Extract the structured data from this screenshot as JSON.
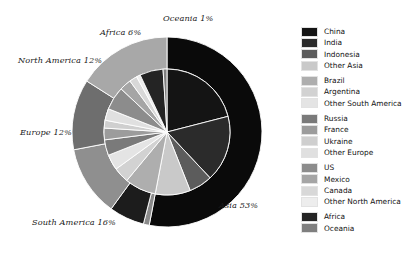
{
  "chart_data": {
    "type": "pie",
    "title": "",
    "subtitle": "",
    "xlabel": "",
    "ylabel": "",
    "legend_position": "right",
    "grid": false,
    "nested": true,
    "outer_ring": {
      "name": "Continent",
      "categories": [
        "Asia",
        "Oceania",
        "Africa",
        "North America",
        "Europe",
        "South America"
      ],
      "values": [
        53,
        1,
        6,
        12,
        12,
        16
      ],
      "labels": [
        "Asia 53%",
        "Oceania 1%",
        "Africa 6%",
        "North America 12%",
        "Europe 12%",
        "South America 16%"
      ],
      "colors": [
        "#0a0a0a",
        "#8a8a8a",
        "#1c1c1c",
        "#8f8f8f",
        "#6e6e6e",
        "#a8a8a8"
      ]
    },
    "inner_pie": {
      "name": "Country",
      "categories": [
        "China",
        "India",
        "Indonesia",
        "Other Asia",
        "Brazil",
        "Argentina",
        "Other South America",
        "Russia",
        "France",
        "Ukraine",
        "Other Europe",
        "US",
        "Mexico",
        "Canada",
        "Other North America",
        "Africa",
        "Oceania"
      ],
      "values": [
        21,
        17,
        6,
        9,
        8,
        4,
        4,
        4,
        3,
        2,
        3,
        6,
        3,
        2,
        1,
        6,
        1
      ],
      "colors": [
        "#141414",
        "#2b2b2b",
        "#5c5c5c",
        "#c9c9c9",
        "#aeaeae",
        "#d2d2d2",
        "#e4e4e4",
        "#7a7a7a",
        "#9c9c9c",
        "#cfcfcf",
        "#e0e0e0",
        "#8c8c8c",
        "#a5a5a5",
        "#d8d8d8",
        "#ededed",
        "#242424",
        "#7f7f7f"
      ]
    }
  },
  "legend": {
    "groups": [
      {
        "name": "asia",
        "items": [
          {
            "label": "China",
            "color": "#141414"
          },
          {
            "label": "India",
            "color": "#2b2b2b"
          },
          {
            "label": "Indonesia",
            "color": "#5c5c5c"
          },
          {
            "label": "Other Asia",
            "color": "#c9c9c9"
          }
        ]
      },
      {
        "name": "south-america",
        "items": [
          {
            "label": "Brazil",
            "color": "#aeaeae"
          },
          {
            "label": "Argentina",
            "color": "#d2d2d2"
          },
          {
            "label": "Other South America",
            "color": "#e4e4e4"
          }
        ]
      },
      {
        "name": "europe",
        "items": [
          {
            "label": "Russia",
            "color": "#7a7a7a"
          },
          {
            "label": "France",
            "color": "#9c9c9c"
          },
          {
            "label": "Ukraine",
            "color": "#cfcfcf"
          },
          {
            "label": "Other Europe",
            "color": "#e0e0e0"
          }
        ]
      },
      {
        "name": "north-america",
        "items": [
          {
            "label": "US",
            "color": "#8c8c8c"
          },
          {
            "label": "Mexico",
            "color": "#a5a5a5"
          },
          {
            "label": "Canada",
            "color": "#d8d8d8"
          },
          {
            "label": "Other North America",
            "color": "#ededed"
          }
        ]
      },
      {
        "name": "africa-oceania",
        "items": [
          {
            "label": "Africa",
            "color": "#242424"
          },
          {
            "label": "Oceania",
            "color": "#7f7f7f"
          }
        ]
      }
    ]
  },
  "geometry": {
    "center_x": 167,
    "center_y": 132,
    "inner_radius": 63,
    "outer_radius": 95,
    "start_angle_deg": -90
  },
  "label_positions": [
    {
      "key": "Oceania 1%",
      "left": 163,
      "top": 14,
      "anchor": "left"
    },
    {
      "key": "Africa 6%",
      "left": 100,
      "top": 28,
      "anchor": "left"
    },
    {
      "key": "North America 12%",
      "left": 18,
      "top": 56,
      "anchor": "left"
    },
    {
      "key": "Europe 12%",
      "left": 20,
      "top": 128,
      "anchor": "left"
    },
    {
      "key": "South America 16%",
      "left": 32,
      "top": 218,
      "anchor": "left"
    },
    {
      "key": "Asia 53%",
      "left": 219,
      "top": 201,
      "anchor": "left"
    }
  ]
}
